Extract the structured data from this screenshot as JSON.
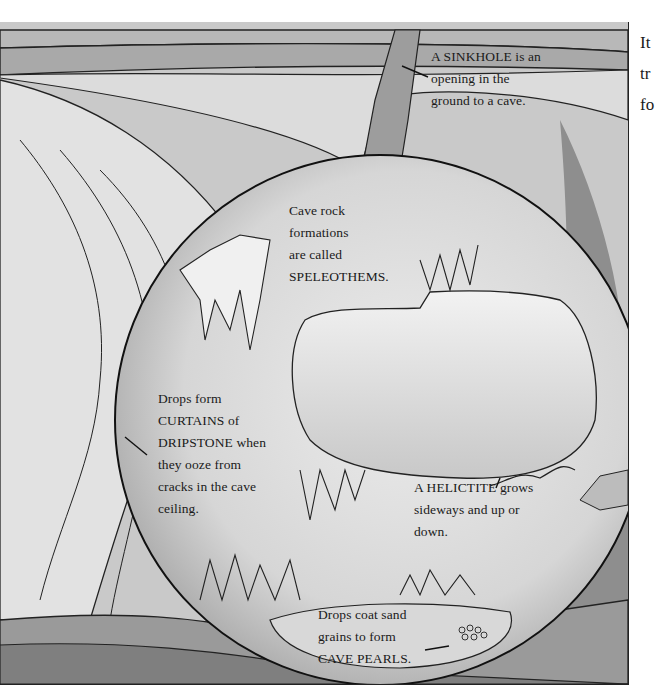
{
  "illustration": {
    "title": "Cave formations illustration",
    "labels": {
      "sinkhole": [
        "A SINKHOLE is an",
        "opening in the",
        "ground to a cave."
      ],
      "speleothems": [
        "Cave rock",
        "formations",
        "are called",
        "SPELEOTHEMS."
      ],
      "dripstone": [
        "Drops form",
        "CURTAINS of",
        "DRIPSTONE when",
        "they ooze from",
        "cracks in the cave",
        "ceiling."
      ],
      "helictite": [
        "A HELICTITE grows",
        "sideways and up or",
        "down."
      ],
      "cave_pearls": [
        "Drops coat sand",
        "grains to form",
        "CAVE PEARLS."
      ]
    }
  },
  "side_text": {
    "lines": [
      "It",
      "tr",
      "fo"
    ]
  },
  "colors": {
    "paper": "#ffffff",
    "ink": "#1a1a1a",
    "wash_light": "#e6e6e6",
    "wash_mid": "#bdbdbd",
    "wash_dark": "#8a8a8a"
  }
}
